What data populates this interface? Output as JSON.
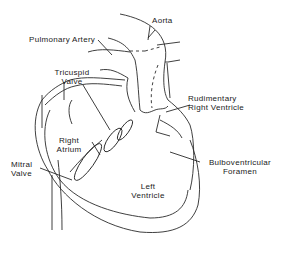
{
  "diagram": {
    "type": "anatomical line drawing",
    "labels": {
      "aorta": "Aorta",
      "pulmonary_artery": "Pulmonary Artery",
      "tricuspid_valve": [
        "Tricuspid",
        "Valve"
      ],
      "rudimentary_right_ventricle": [
        "Rudimentary",
        "Right Ventricle"
      ],
      "right_atrium": [
        "Right",
        "Atrium"
      ],
      "mitral_valve": [
        "Mitral",
        "Valve"
      ],
      "bulboventricular_foramen": [
        "Bulboventricular",
        "Foramen"
      ],
      "left_ventricle": [
        "Left",
        "Ventricle"
      ]
    },
    "colors": {
      "line": "#2a2a2a",
      "background": "#ffffff"
    }
  }
}
